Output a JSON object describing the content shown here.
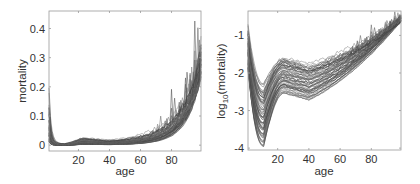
{
  "chart_data": [
    {
      "type": "line",
      "title": "",
      "xlabel": "age",
      "ylabel": "mortality",
      "xlim": [
        1,
        99
      ],
      "ylim": [
        -0.02,
        0.46
      ],
      "xticks": [
        20,
        40,
        60,
        80
      ],
      "xtick_labels": [
        "20",
        "40",
        "60",
        "80"
      ],
      "yticks": [
        0,
        0.1,
        0.2,
        0.3,
        0.4
      ],
      "ytick_labels": [
        "0",
        "0.1",
        "0.2",
        "0.3",
        "0.4"
      ],
      "grid": false,
      "legend": null,
      "series_description": "Many overlapping gray curves (one per year/population); near 0.1-0.17 at age 1, drop to ~0.002 by age 10, stay near 0.005-0.02 until age 60, then rise exponentially to ~0.25-0.43 at age 99 with noisy spikes near ages 70-95",
      "representative_series": [
        {
          "name": "low",
          "x": [
            1,
            10,
            20,
            40,
            60,
            70,
            80,
            90,
            99
          ],
          "values": [
            0.02,
            0.001,
            0.002,
            0.004,
            0.012,
            0.03,
            0.07,
            0.16,
            0.27
          ]
        },
        {
          "name": "median",
          "x": [
            1,
            10,
            20,
            40,
            60,
            70,
            80,
            90,
            99
          ],
          "values": [
            0.06,
            0.002,
            0.004,
            0.006,
            0.018,
            0.04,
            0.09,
            0.2,
            0.36
          ]
        },
        {
          "name": "high",
          "x": [
            1,
            10,
            20,
            40,
            60,
            70,
            80,
            90,
            99
          ],
          "values": [
            0.17,
            0.004,
            0.015,
            0.02,
            0.03,
            0.06,
            0.13,
            0.26,
            0.43
          ]
        }
      ]
    },
    {
      "type": "line",
      "title": "",
      "xlabel": "age",
      "ylabel": "log10(mortality)",
      "ylabel_base": "log",
      "ylabel_sub": "10",
      "ylabel_rest": "(mortality)",
      "xlim": [
        1,
        99
      ],
      "ylim": [
        -4.05,
        -0.35
      ],
      "xticks": [
        20,
        40,
        60,
        80
      ],
      "xtick_labels": [
        "20",
        "40",
        "60",
        "80"
      ],
      "yticks": [
        -4,
        -3,
        -2,
        -1
      ],
      "ytick_labels": [
        "-4",
        "-3",
        "-2",
        "-1"
      ],
      "grid": false,
      "legend": null,
      "series_description": "Same curves on log10 scale; start ~-0.8 to -2 at age 1, trough between -2.2 and -3.9 around age 10-12, accident hump near age 20, then near-linear rise converging to ~-0.5 at age 99",
      "representative_series": [
        {
          "name": "low",
          "x": [
            1,
            12,
            22,
            40,
            60,
            80,
            99
          ],
          "values": [
            -1.9,
            -3.9,
            -3.1,
            -2.7,
            -1.9,
            -1.15,
            -0.55
          ]
        },
        {
          "name": "median",
          "x": [
            1,
            12,
            22,
            40,
            60,
            80,
            99
          ],
          "values": [
            -1.3,
            -3.1,
            -2.6,
            -2.3,
            -1.75,
            -1.05,
            -0.5
          ]
        },
        {
          "name": "high",
          "x": [
            1,
            12,
            22,
            40,
            60,
            80,
            99
          ],
          "values": [
            -0.8,
            -2.2,
            -1.7,
            -1.7,
            -1.5,
            -0.95,
            -0.45
          ]
        }
      ]
    }
  ],
  "panels": {
    "left": {
      "ylabel": "mortality",
      "xlabel": "age"
    },
    "right": {
      "ylabel_base": "log",
      "ylabel_sub": "10",
      "ylabel_rest": "(mortality)",
      "xlabel": "age"
    }
  },
  "style": {
    "curve_color": "#4a4a4a",
    "frame_color": "#9a9a9a",
    "text_color": "#333333"
  }
}
